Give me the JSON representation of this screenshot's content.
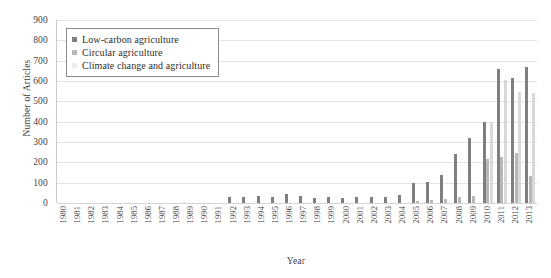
{
  "chart_data": {
    "type": "bar",
    "title": "",
    "xlabel": "Year",
    "ylabel": "Number of Articles",
    "ylim": [
      0,
      900
    ],
    "ytick_step": 100,
    "yticks": [
      900,
      800,
      700,
      600,
      500,
      400,
      300,
      200,
      100,
      0
    ],
    "grid": true,
    "legend_position": "top-left",
    "categories": [
      "1980",
      "1981",
      "1982",
      "1983",
      "1984",
      "1985",
      "1986",
      "1987",
      "1988",
      "1989",
      "1990",
      "1991",
      "1992",
      "1993",
      "1994",
      "1995",
      "1996",
      "1997",
      "1998",
      "1999",
      "2000",
      "2001",
      "2002",
      "2003",
      "2004",
      "2005",
      "2006",
      "2007",
      "2008",
      "2009",
      "2010",
      "2011",
      "2012",
      "2013"
    ],
    "series": [
      {
        "name": "Low-carbon agriculture",
        "color": "#7f7f7f",
        "values": [
          0,
          0,
          0,
          0,
          0,
          0,
          0,
          0,
          0,
          0,
          0,
          0,
          30,
          30,
          35,
          30,
          45,
          35,
          25,
          30,
          25,
          30,
          30,
          30,
          40,
          100,
          105,
          140,
          240,
          320,
          400,
          660,
          615,
          670
        ]
      },
      {
        "name": "Circular agriculture",
        "color": "#b8b8b8",
        "values": [
          0,
          0,
          0,
          0,
          0,
          0,
          0,
          0,
          0,
          0,
          0,
          0,
          0,
          0,
          0,
          0,
          0,
          0,
          0,
          0,
          0,
          0,
          0,
          0,
          0,
          10,
          15,
          20,
          30,
          35,
          215,
          225,
          245,
          135
        ]
      },
      {
        "name": "Climate change and agriculture",
        "color": "#d9d9d9",
        "values": [
          0,
          0,
          0,
          0,
          0,
          0,
          0,
          0,
          0,
          0,
          0,
          0,
          0,
          0,
          0,
          0,
          0,
          0,
          0,
          0,
          0,
          0,
          0,
          0,
          0,
          0,
          0,
          0,
          0,
          0,
          400,
          605,
          545,
          540
        ]
      }
    ]
  },
  "legend": {
    "items": [
      {
        "label": "Low-carbon agriculture",
        "color": "#7f7f7f"
      },
      {
        "label": "Circular agriculture",
        "color": "#b8b8b8"
      },
      {
        "label": "Climate change and agriculture",
        "color": "#ededed"
      }
    ]
  }
}
